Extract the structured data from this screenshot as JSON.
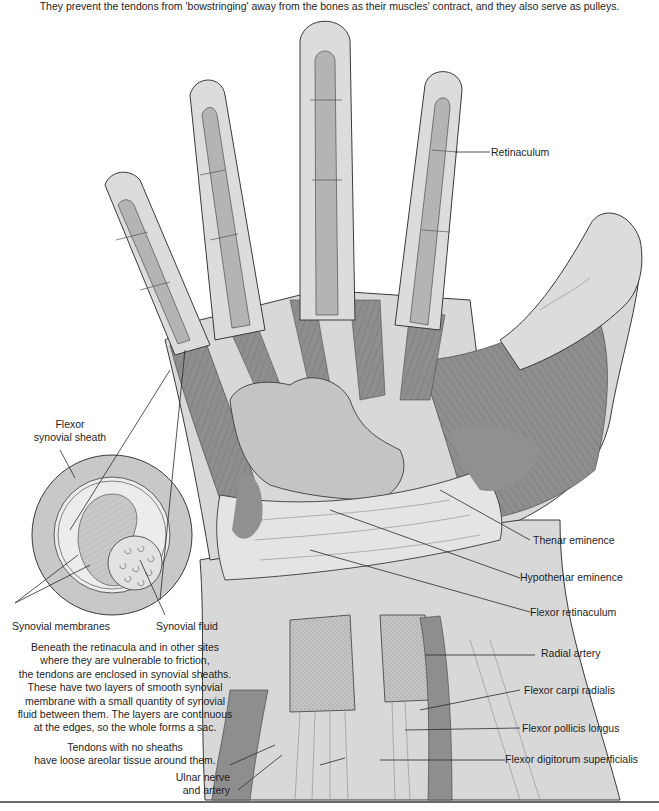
{
  "figure": {
    "top_caption": "They prevent the tendons from 'bowstringing' away from the bones as their muscles' contract, and they also serve as pulleys.",
    "colors": {
      "skin_light": "#dcdcdc",
      "skin_mid": "#c8c8c8",
      "tendon": "#b4b4b4",
      "muscle": "#8c8c8c",
      "muscle_dark": "#7a7a7a",
      "outline": "#3a3a3a",
      "background": "#ffffff"
    }
  },
  "labels": {
    "retinaculum": "Retinaculum",
    "flexor_synovial_sheath_line1": "Flexor",
    "flexor_synovial_sheath_line2": "synovial sheath",
    "synovial_membranes": "Synovial membranes",
    "synovial_fluid": "Synovial fluid",
    "thenar_eminence": "Thenar eminence",
    "hypothenar_eminence": "Hypothenar eminence",
    "flexor_retinaculum": "Flexor retinaculum",
    "radial_artery": "Radial artery",
    "flexor_carpi_radialis": "Flexor carpi radialis",
    "flexor_pollicis_longus": "Flexor pollicis longus",
    "flexor_digitorum_superficialis": "Flexor digitorum superficialis",
    "ulnar_nerve_line1": "Ulnar nerve",
    "ulnar_nerve_line2": "and artery"
  },
  "notes": {
    "sheath_paragraph": [
      "Beneath the retinacula and in other sites",
      "where they are vulnerable to friction,",
      "the tendons are enclosed in synovial sheaths.",
      "These have two layers of smooth synovial",
      "membrane with a small quantity of synovial",
      "fluid between them. The layers are continuous",
      "at the edges, so the whole forms a sac."
    ],
    "no_sheath_paragraph": [
      "Tendons with no sheaths",
      "have loose areolar tissue around them."
    ]
  }
}
